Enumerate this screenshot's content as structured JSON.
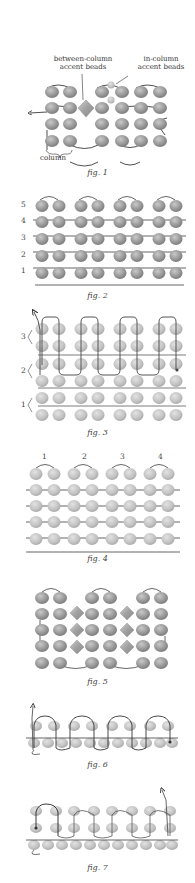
{
  "colors": {
    "bead_fill": "#9a9a9a",
    "bead_light": "#c4c4c4",
    "bead_faded": "#c8c8c8",
    "thread": "#222222",
    "thread_path": "#555555",
    "background": "#ffffff"
  },
  "figures": [
    {
      "id": "fig1",
      "caption": "fig. 1",
      "labels": {
        "between_column": "between-column\naccent beads",
        "between_column_line1": "between-column",
        "between_column_line2": "accent beads",
        "in_column_line1": "in-column",
        "in_column_line2": "accent beads",
        "column": "column"
      }
    },
    {
      "id": "fig2",
      "caption": "fig. 2",
      "row_numbers": [
        "5",
        "4",
        "3",
        "2",
        "1"
      ]
    },
    {
      "id": "fig3",
      "caption": "fig. 3",
      "row_numbers": [
        "3",
        "2",
        "1"
      ]
    },
    {
      "id": "fig4",
      "caption": "fig. 4",
      "column_numbers": [
        "1",
        "2",
        "3",
        "4"
      ]
    },
    {
      "id": "fig5",
      "caption": "fig. 5"
    },
    {
      "id": "fig6",
      "caption": "fig. 6"
    },
    {
      "id": "fig7",
      "caption": "fig. 7"
    }
  ]
}
